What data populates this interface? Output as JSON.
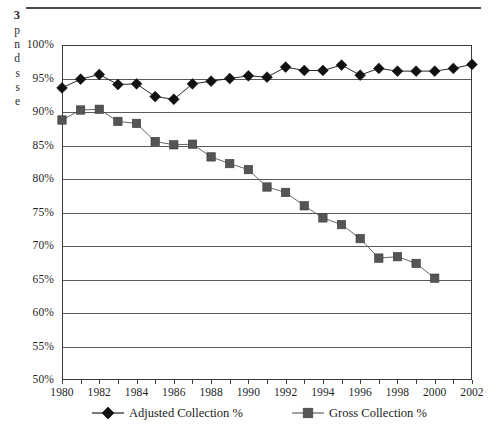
{
  "page": {
    "caption_fragment": {
      "number": "3",
      "lines": [
        "p",
        "n",
        "d",
        "s",
        "s",
        "e"
      ]
    },
    "rule_color": "#4a4a4a"
  },
  "colors": {
    "adjusted_series": "#111111",
    "gross_series": "#555555",
    "gridline": "#5a5a5a",
    "frame": "#3c3c3c",
    "text": "#1a1a1a",
    "background": "#ffffff"
  },
  "chart_data": {
    "type": "line",
    "title": "",
    "xlabel": "",
    "ylabel": "",
    "xlim": [
      1980,
      2002
    ],
    "ylim": [
      50,
      100
    ],
    "ytick_labels": [
      "100%",
      "95%",
      "90%",
      "85%",
      "80%",
      "75%",
      "70%",
      "65%",
      "60%",
      "55%",
      "50%"
    ],
    "ytick_values": [
      100,
      95,
      90,
      85,
      80,
      75,
      70,
      65,
      60,
      55,
      50
    ],
    "xtick_labels": [
      "1980",
      "1982",
      "1984",
      "1986",
      "1988",
      "1990",
      "1992",
      "1994",
      "1996",
      "1998",
      "2000",
      "2002"
    ],
    "xtick_values": [
      1980,
      1982,
      1984,
      1986,
      1988,
      1990,
      1992,
      1994,
      1996,
      1998,
      2000,
      2002
    ],
    "grid": true,
    "legend_position": "bottom",
    "x": [
      1980,
      1981,
      1982,
      1983,
      1984,
      1985,
      1986,
      1987,
      1988,
      1989,
      1990,
      1991,
      1992,
      1993,
      1994,
      1995,
      1996,
      1997,
      1998,
      1999,
      2000,
      2001,
      2002
    ],
    "series": [
      {
        "name": "Adjusted Collection %",
        "marker": "diamond",
        "color": "#111111",
        "x": [
          1980,
          1981,
          1982,
          1983,
          1984,
          1985,
          1986,
          1987,
          1988,
          1989,
          1990,
          1991,
          1992,
          1993,
          1994,
          1995,
          1996,
          1997,
          1998,
          1999,
          2000,
          2001,
          2002
        ],
        "values": [
          93.6,
          94.9,
          95.6,
          94.1,
          94.2,
          92.3,
          91.9,
          94.2,
          94.6,
          95.0,
          95.4,
          95.2,
          96.7,
          96.2,
          96.2,
          97.0,
          95.5,
          96.5,
          96.1,
          96.1,
          96.1,
          96.5,
          97.1
        ]
      },
      {
        "name": "Gross Collection %",
        "marker": "square",
        "color": "#555555",
        "x": [
          1980,
          1981,
          1982,
          1983,
          1984,
          1985,
          1986,
          1987,
          1988,
          1989,
          1990,
          1991,
          1992,
          1993,
          1994,
          1995,
          1996,
          1997,
          1998,
          1999,
          2000
        ],
        "values": [
          88.8,
          90.3,
          90.4,
          88.6,
          88.3,
          85.6,
          85.1,
          85.2,
          83.3,
          82.3,
          81.4,
          78.8,
          78.0,
          76.0,
          74.2,
          73.2,
          71.1,
          68.2,
          68.4,
          67.4,
          65.2
        ]
      }
    ]
  },
  "legend": {
    "items": [
      {
        "label": "Adjusted Collection %",
        "marker": "diamond",
        "color": "#111111",
        "left_px": 30
      },
      {
        "label": "Gross Collection %",
        "marker": "square",
        "color": "#555555",
        "left_px": 230
      }
    ]
  }
}
